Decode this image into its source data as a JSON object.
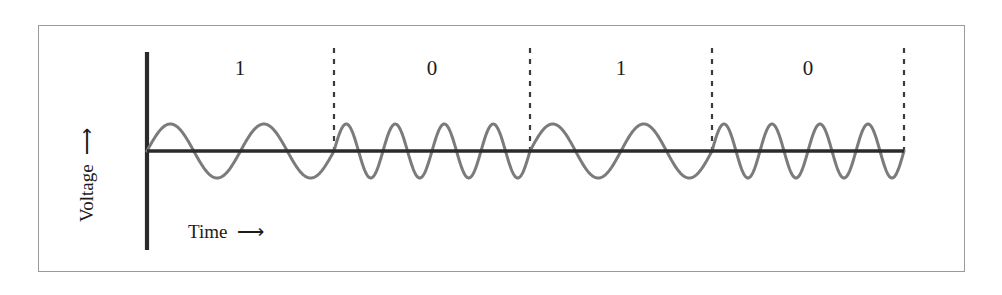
{
  "figure": {
    "type": "fsk-modulation-waveform",
    "axis_labels": {
      "y": "Voltage",
      "y_arrow": "arrow-up-icon",
      "x": "Time",
      "x_arrow": "arrow-right-icon"
    },
    "bits": [
      {
        "label": "1",
        "center_x": 240
      },
      {
        "label": "0",
        "center_x": 432
      },
      {
        "label": "1",
        "center_x": 621
      },
      {
        "label": "0",
        "center_x": 808
      }
    ],
    "colors": {
      "border": "#9a9a9a",
      "axis": "#2a2a2a",
      "waveform": "#7b7b7b",
      "divider": "#3a3a3a",
      "text": "#1c1c1c",
      "background": "#ffffff"
    }
  },
  "chart_data": {
    "type": "line",
    "title": "",
    "xlabel": "Time",
    "ylabel": "Voltage",
    "grid": false,
    "legend": null,
    "axes": {
      "y_axis_x": 147,
      "y_axis_top": 52,
      "y_axis_bottom": 250,
      "baseline_y": 151,
      "x_axis_start": 147,
      "x_axis_end": 904,
      "amplitude_px": 27
    },
    "bit_sequence": [
      "1",
      "0",
      "1",
      "0"
    ],
    "segment_boundaries": [
      147,
      334,
      530,
      712,
      904
    ],
    "dashed_divider_x": [
      334,
      530,
      712,
      904
    ],
    "dashed_divider_top": 48,
    "series": [
      {
        "name": "FSK carrier",
        "segments": [
          {
            "bit": "1",
            "x_start": 147,
            "x_end": 334,
            "cycles": 2,
            "frequency": "low"
          },
          {
            "bit": "0",
            "x_start": 334,
            "x_end": 530,
            "cycles": 4,
            "frequency": "high"
          },
          {
            "bit": "1",
            "x_start": 530,
            "x_end": 712,
            "cycles": 2,
            "frequency": "low"
          },
          {
            "bit": "0",
            "x_start": 712,
            "x_end": 904,
            "cycles": 4,
            "frequency": "high"
          }
        ]
      }
    ]
  }
}
